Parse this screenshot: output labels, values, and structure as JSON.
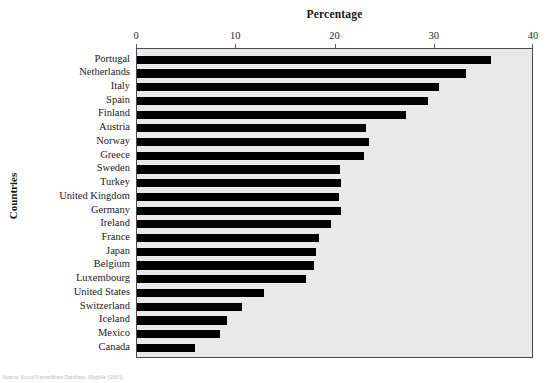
{
  "chart_data": {
    "type": "bar",
    "orientation": "horizontal",
    "title": "Percentage",
    "xlabel": "Percentage",
    "ylabel": "Countries",
    "xlim": [
      0,
      40
    ],
    "xticks": [
      0,
      10,
      20,
      30,
      40
    ],
    "xticklabels": [
      "0",
      "10",
      "20",
      "30",
      "40"
    ],
    "grid": false,
    "legend": null,
    "bar_color": "#000000",
    "plot_background": "#e9e9e9",
    "categories": [
      "Portugal",
      "Netherlands",
      "Italy",
      "Spain",
      "Finland",
      "Austria",
      "Norway",
      "Greece",
      "Sweden",
      "Turkey",
      "United Kingdom",
      "Germany",
      "Ireland",
      "France",
      "Japan",
      "Belgium",
      "Luxembourg",
      "United States",
      "Switzerland",
      "Iceland",
      "Mexico",
      "Canada"
    ],
    "values": [
      35.7,
      33.1,
      30.4,
      29.3,
      27.1,
      23.1,
      23.4,
      22.9,
      20.5,
      20.6,
      20.4,
      20.6,
      19.5,
      18.3,
      18.0,
      17.8,
      17.0,
      12.8,
      10.6,
      9.1,
      8.4,
      5.8
    ]
  },
  "footnote": {
    "text": "Source: Social Expenditure Database, illegible (2003)"
  }
}
